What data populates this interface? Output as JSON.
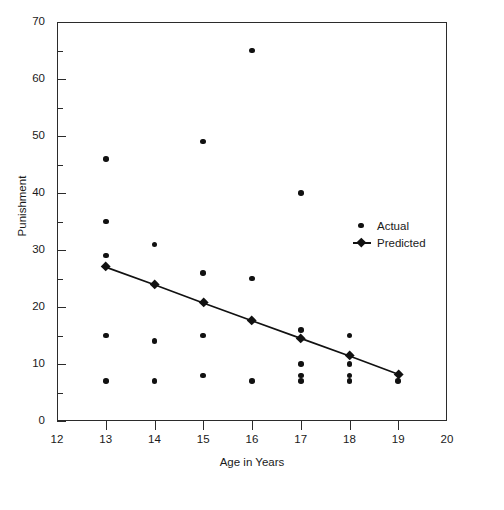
{
  "chart_data": {
    "type": "scatter",
    "title": "",
    "xlabel": "Age in Years",
    "ylabel": "Punishment",
    "xlim": [
      12,
      20
    ],
    "ylim": [
      0,
      70
    ],
    "grid": false,
    "legend_position": "right-middle",
    "x_ticks": [
      12,
      13,
      14,
      15,
      16,
      17,
      18,
      19,
      20
    ],
    "y_ticks": [
      0,
      10,
      20,
      30,
      40,
      50,
      60,
      70
    ],
    "y_minor_ticks": [
      5,
      15,
      25,
      35,
      45,
      55,
      65
    ],
    "series": [
      {
        "name": "Actual",
        "marker": "circle",
        "points": [
          {
            "x": 13,
            "y": 46
          },
          {
            "x": 13,
            "y": 35
          },
          {
            "x": 13,
            "y": 29
          },
          {
            "x": 13,
            "y": 15
          },
          {
            "x": 13,
            "y": 7
          },
          {
            "x": 14,
            "y": 31
          },
          {
            "x": 14,
            "y": 14
          },
          {
            "x": 14,
            "y": 7
          },
          {
            "x": 15,
            "y": 49
          },
          {
            "x": 15,
            "y": 26
          },
          {
            "x": 15,
            "y": 15
          },
          {
            "x": 15,
            "y": 8
          },
          {
            "x": 16,
            "y": 65
          },
          {
            "x": 16,
            "y": 25
          },
          {
            "x": 16,
            "y": 7
          },
          {
            "x": 17,
            "y": 40
          },
          {
            "x": 17,
            "y": 16
          },
          {
            "x": 17,
            "y": 10
          },
          {
            "x": 17,
            "y": 8
          },
          {
            "x": 17,
            "y": 7
          },
          {
            "x": 18,
            "y": 15
          },
          {
            "x": 18,
            "y": 10
          },
          {
            "x": 18,
            "y": 8
          },
          {
            "x": 18,
            "y": 7
          },
          {
            "x": 19,
            "y": 7
          }
        ]
      },
      {
        "name": "Predicted",
        "marker": "diamond-line",
        "points": [
          {
            "x": 13,
            "y": 27.0
          },
          {
            "x": 14,
            "y": 23.9
          },
          {
            "x": 15,
            "y": 20.7
          },
          {
            "x": 16,
            "y": 17.6
          },
          {
            "x": 17,
            "y": 14.5
          },
          {
            "x": 18,
            "y": 11.4
          },
          {
            "x": 19,
            "y": 8.2
          }
        ]
      }
    ]
  },
  "legend": {
    "entries": [
      {
        "label": "Actual"
      },
      {
        "label": "Predicted"
      }
    ]
  },
  "axis_labels": {
    "x": "Age in Years",
    "y": "Punishment"
  }
}
